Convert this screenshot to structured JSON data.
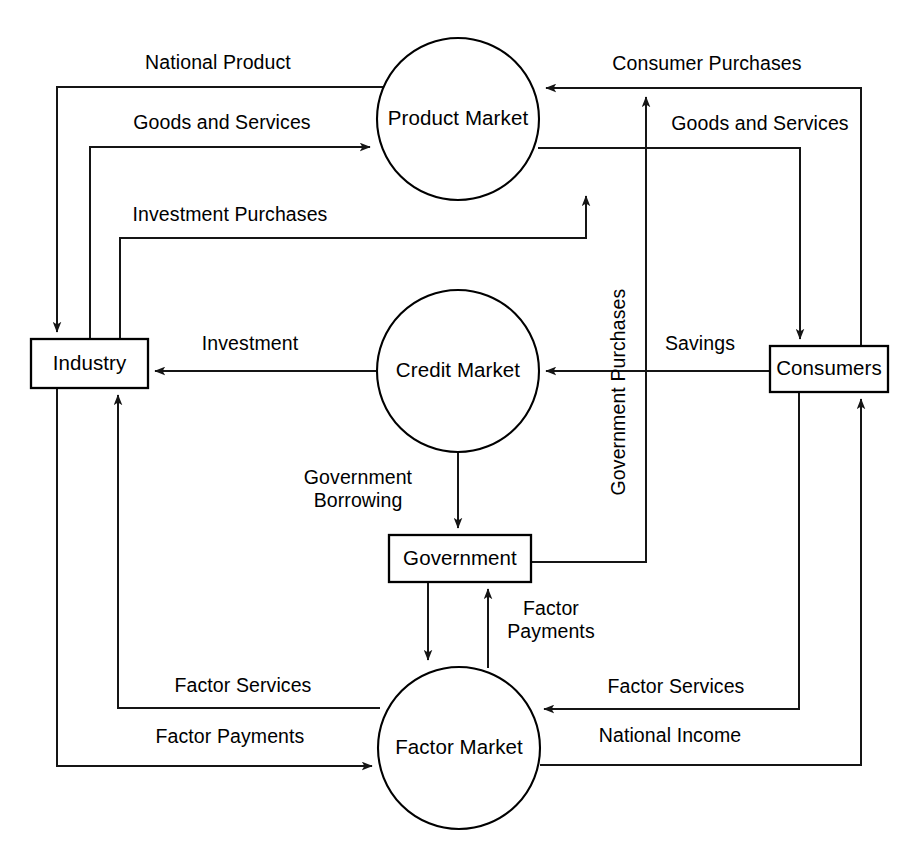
{
  "diagram": {
    "type": "flow-diagram",
    "background_color": "#ffffff",
    "line_color": "#151515",
    "text_color": "#000000",
    "width": 920,
    "height": 854
  },
  "nodes": [
    {
      "id": "product_market",
      "label": "Product Market",
      "shape": "circle",
      "cx": 458,
      "cy": 119,
      "r": 81
    },
    {
      "id": "credit_market",
      "label": "Credit Market",
      "shape": "circle",
      "cx": 458,
      "cy": 371,
      "r": 81
    },
    {
      "id": "factor_market",
      "label": "Factor Market",
      "shape": "circle",
      "cx": 459,
      "cy": 748,
      "r": 81
    },
    {
      "id": "industry",
      "label": "Industry",
      "shape": "rect",
      "x": 31,
      "y": 339,
      "w": 117,
      "h": 49
    },
    {
      "id": "consumers",
      "label": "Consumers",
      "shape": "rect",
      "x": 770,
      "y": 346,
      "w": 118,
      "h": 46
    },
    {
      "id": "government",
      "label": "Government",
      "shape": "rect",
      "x": 389,
      "y": 535,
      "w": 142,
      "h": 47
    }
  ],
  "edges": [
    {
      "id": "national_product",
      "label": "National Product",
      "from": "product_market",
      "to": "industry",
      "label_x": 218,
      "label_y": 64,
      "orientation": "horizontal",
      "path": "M 455,87 L 57,87 L 57,332"
    },
    {
      "id": "goods_services_industry",
      "label": "Goods and Services",
      "from": "industry",
      "to": "product_market",
      "label_x": 222,
      "label_y": 124,
      "orientation": "horizontal",
      "path": "M 90,339 L 90,147 L 370,147"
    },
    {
      "id": "investment_purchases",
      "label": "Investment Purchases",
      "from": "industry",
      "to": "product_market",
      "label_x": 230,
      "label_y": 216,
      "orientation": "horizontal",
      "path": "M 120,339 L 120,238 L 586,238 L 586,196"
    },
    {
      "id": "consumer_purchases",
      "label": "Consumer Purchases",
      "from": "consumers",
      "to": "product_market",
      "label_x": 707,
      "label_y": 65,
      "orientation": "horizontal",
      "path": "M 861,346 L 861,88 L 546,88"
    },
    {
      "id": "goods_services_consumers",
      "label": "Goods and Services",
      "from": "product_market",
      "to": "consumers",
      "label_x": 760,
      "label_y": 125,
      "orientation": "horizontal",
      "path": "M 538,148 L 800,148 L 800,339"
    },
    {
      "id": "investment",
      "label": "Investment",
      "from": "credit_market",
      "to": "industry",
      "label_x": 250,
      "label_y": 345,
      "orientation": "horizontal",
      "path": "M 377,371 L 155,371"
    },
    {
      "id": "savings",
      "label": "Savings",
      "from": "consumers",
      "to": "credit_market",
      "label_x": 700,
      "label_y": 345,
      "orientation": "horizontal",
      "path": "M 770,371 L 546,371"
    },
    {
      "id": "government_borrowing",
      "label": "Government\nBorrowing",
      "label_line_1": "Government",
      "label_line_2": "Borrowing",
      "from": "credit_market",
      "to": "government",
      "label_x": 358,
      "label_y": 490,
      "orientation": "horizontal",
      "path": "M 458,452 L 458,528"
    },
    {
      "id": "government_purchases",
      "label": "Government Purchases",
      "from": "government",
      "to": "product_market",
      "label_x": 620,
      "label_y": 392,
      "orientation": "vertical",
      "path": "M 531,562 L 646,562 L 646,97"
    },
    {
      "id": "factor_services_industry",
      "label": "Factor Services",
      "from": "factor_market",
      "to": "industry",
      "label_x": 243,
      "label_y": 687,
      "orientation": "horizontal",
      "path": "M 380,708 L 118,708 L 118,395"
    },
    {
      "id": "factor_payments_industry",
      "label": "Factor Payments",
      "from": "industry",
      "to": "factor_market",
      "label_x": 230,
      "label_y": 738,
      "orientation": "horizontal",
      "path": "M 57,388 L 57,766 L 372,766"
    },
    {
      "id": "factor_services_consumers",
      "label": "Factor Services",
      "from": "consumers",
      "to": "factor_market",
      "label_x": 676,
      "label_y": 688,
      "orientation": "horizontal",
      "path": "M 799,392 L 799,709 L 544,709"
    },
    {
      "id": "national_income",
      "label": "National Income",
      "from": "factor_market",
      "to": "consumers",
      "label_x": 670,
      "label_y": 737,
      "orientation": "horizontal",
      "path": "M 540,765 L 861,765 L 861,399"
    },
    {
      "id": "factor_payments_government",
      "label": "Factor\nPayments",
      "label_line_1": "Factor",
      "label_line_2": "Payments",
      "from": "factor_market",
      "to": "government",
      "label_x": 551,
      "label_y": 621,
      "orientation": "horizontal",
      "path": "M 488,668 L 488,589"
    },
    {
      "id": "government_to_factor_market",
      "label": "",
      "from": "government",
      "to": "factor_market",
      "label_x": 0,
      "label_y": 0,
      "orientation": "horizontal",
      "path": "M 428,582 L 428,660"
    }
  ]
}
